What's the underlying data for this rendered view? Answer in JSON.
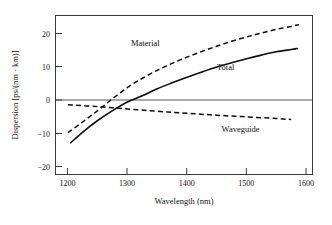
{
  "chart_data": {
    "type": "line",
    "title": "",
    "xlabel": "Wavelength (nm)",
    "ylabel": "Dispersion [ps/(nm · km)]",
    "xlim": [
      1180,
      1610
    ],
    "ylim": [
      -24,
      24
    ],
    "xticks": [
      1200,
      1300,
      1400,
      1500,
      1600
    ],
    "xtick_labels": [
      "1200",
      "1300",
      "1400",
      "1500",
      "1600"
    ],
    "yticks": [
      20,
      10,
      0,
      -10,
      -20
    ],
    "ytick_labels": [
      "20",
      "10",
      "0",
      "−10",
      "−20"
    ],
    "grid": false,
    "legend_position": "inline-annotations",
    "zero_reference_line": true,
    "series": [
      {
        "name": "Material",
        "style": "dashed",
        "label_text": "Material",
        "x": [
          1200,
          1225,
          1250,
          1275,
          1300,
          1325,
          1350,
          1375,
          1400,
          1425,
          1450,
          1475,
          1500,
          1525,
          1550,
          1575,
          1588
        ],
        "values": [
          -11.5,
          -8.2,
          -4.8,
          -1.2,
          2.2,
          5.0,
          7.4,
          9.5,
          11.4,
          13.1,
          14.7,
          16.2,
          17.5,
          18.7,
          19.8,
          20.7,
          21.2
        ]
      },
      {
        "name": "Total",
        "style": "solid",
        "label_text": "Total",
        "x": [
          1205,
          1225,
          1250,
          1275,
          1300,
          1325,
          1350,
          1375,
          1400,
          1425,
          1450,
          1475,
          1500,
          1525,
          1550,
          1575,
          1585
        ],
        "values": [
          -14.5,
          -11.3,
          -7.8,
          -4.8,
          -2.2,
          -0.3,
          1.8,
          3.6,
          5.3,
          6.9,
          8.4,
          9.7,
          10.9,
          12.0,
          13.0,
          13.7,
          14.0
        ]
      },
      {
        "name": "Waveguide",
        "style": "dashed",
        "label_text": "Waveguide",
        "x": [
          1200,
          1250,
          1300,
          1350,
          1400,
          1450,
          1500,
          1550,
          1575
        ],
        "values": [
          -3.0,
          -3.6,
          -4.3,
          -5.0,
          -5.6,
          -6.2,
          -6.7,
          -7.2,
          -7.5
        ]
      }
    ],
    "annotations": [
      {
        "text": "Material",
        "x": 1330,
        "y": 14.8
      },
      {
        "text": "Total",
        "x": 1465,
        "y": 7.6
      },
      {
        "text": "Waveguide",
        "x": 1490,
        "y": -11.2
      }
    ],
    "colors": {
      "curve": "#0d0d0d",
      "frame": "#3a3a3a",
      "zero_line": "#555555",
      "background": "#ffffff"
    }
  }
}
